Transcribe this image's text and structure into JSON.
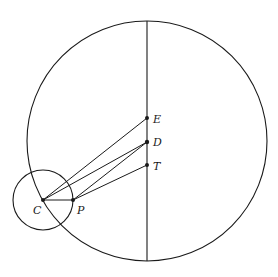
{
  "diagram": {
    "big_circle": {
      "cx": 147,
      "cy": 141,
      "r": 120
    },
    "small_circle": {
      "cx": 43,
      "cy": 200,
      "r": 30
    },
    "axis_line": {
      "x": 147,
      "y1": 21,
      "y2": 261
    },
    "points": {
      "E": {
        "x": 147,
        "y": 118,
        "label": "E"
      },
      "D": {
        "x": 147,
        "y": 142,
        "label": "D"
      },
      "T": {
        "x": 147,
        "y": 165,
        "label": "T"
      },
      "C": {
        "x": 43,
        "y": 200,
        "label": "C"
      },
      "P": {
        "x": 73,
        "y": 200,
        "label": "P"
      }
    },
    "segments": [
      [
        "C",
        "E"
      ],
      [
        "C",
        "D"
      ],
      [
        "P",
        "D"
      ],
      [
        "P",
        "T"
      ],
      [
        "C",
        "P"
      ]
    ],
    "stroke_color": "#1a1a1a"
  }
}
